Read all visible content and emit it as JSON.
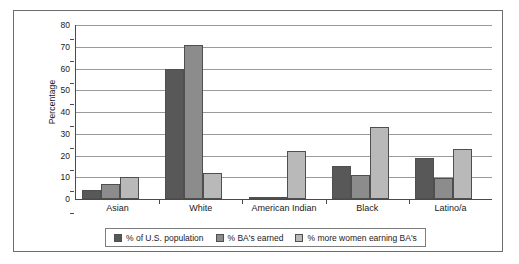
{
  "chart_data": {
    "type": "bar",
    "title": "",
    "subtitle": "",
    "xlabel": "",
    "ylabel": "Percentage",
    "ylim": [
      0,
      80
    ],
    "yticks": [
      0,
      10,
      20,
      30,
      40,
      50,
      60,
      70,
      80
    ],
    "ytick_labels": [
      "0",
      "10",
      "20",
      "30",
      "40",
      "50",
      "60",
      "70",
      "80"
    ],
    "grid": true,
    "legend_position": "bottom",
    "categories": [
      "Asian",
      "White",
      "American Indian",
      "Black",
      "Latino/a"
    ],
    "series": [
      {
        "name": "% of U.S. population",
        "color": "#585858",
        "values": [
          4,
          60,
          1,
          15,
          19
        ]
      },
      {
        "name": "% BA's earned",
        "color": "#8c8c8c",
        "values": [
          7,
          71,
          1,
          11,
          9.5
        ]
      },
      {
        "name": "% more women earning BA's",
        "color": "#b9b9b9",
        "values": [
          10,
          12,
          22,
          33,
          23
        ]
      }
    ]
  },
  "legend": {
    "items": [
      {
        "label": "% of U.S. population"
      },
      {
        "label": "% BA's earned"
      },
      {
        "label": "% more women earning BA's"
      }
    ]
  },
  "colors": {
    "series_dark": "#585858",
    "series_medium": "#8c8c8c",
    "series_light": "#b9b9b9",
    "axis": "#4a4a4a",
    "gridline": "#9a9a9a",
    "frame": "#6c6c6c",
    "text": "#1a1a1a",
    "background": "#ffffff"
  }
}
